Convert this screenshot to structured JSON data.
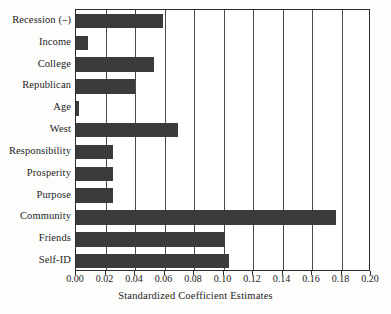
{
  "chart_data": {
    "type": "bar",
    "orientation": "horizontal",
    "title": "",
    "xlabel": "Standardized Coefficient Estimates",
    "ylabel": "",
    "xlim": [
      0.0,
      0.2
    ],
    "xticks": [
      "0.00",
      "0.02",
      "0.04",
      "0.06",
      "0.08",
      "0.10",
      "0.12",
      "0.14",
      "0.16",
      "0.18",
      "0.20"
    ],
    "xtick_values": [
      0.0,
      0.02,
      0.04,
      0.06,
      0.08,
      0.1,
      0.12,
      0.14,
      0.16,
      0.18,
      0.2
    ],
    "grid": "vertical",
    "legend": null,
    "bar_color": "#3b3b3b",
    "background_color": "#ffffff",
    "axis_color": "#2b2b2b",
    "categories": [
      "Recession (–)",
      "Income",
      "College",
      "Republican",
      "Age",
      "West",
      "Responsibility",
      "Prosperity",
      "Purpose",
      "Community",
      "Friends",
      "Self-ID"
    ],
    "values": [
      0.059,
      0.008,
      0.053,
      0.04,
      0.002,
      0.069,
      0.025,
      0.025,
      0.025,
      0.176,
      0.101,
      0.104
    ]
  }
}
